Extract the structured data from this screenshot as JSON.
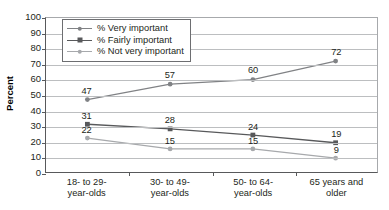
{
  "chart_data": {
    "type": "line",
    "title": "",
    "xlabel": "",
    "ylabel": "Percent",
    "ylim": [
      0,
      100
    ],
    "ytick_step": 10,
    "grid": true,
    "legend_position": "top-left",
    "categories": [
      "18- to 29-\nyear-olds",
      "30- to 49-\nyear-olds",
      "50- to 64-\nyear-olds",
      "65 years and\nolder"
    ],
    "yticks": [
      "0",
      "10",
      "20",
      "30",
      "40",
      "50",
      "60",
      "70",
      "80",
      "90",
      "100"
    ],
    "series": [
      {
        "name": "% Very important",
        "values": [
          47,
          57,
          60,
          72
        ],
        "color": "#808285",
        "marker": "circle"
      },
      {
        "name": "% Fairly important",
        "values": [
          31,
          28,
          24,
          19
        ],
        "color": "#58595b",
        "marker": "square"
      },
      {
        "name": "% Not very important",
        "values": [
          22,
          15,
          15,
          9
        ],
        "color": "#a7a9ac",
        "marker": "circle"
      }
    ]
  },
  "legend": {
    "items": [
      "% Very important",
      "% Fairly important",
      "% Not very important"
    ]
  },
  "axis": {
    "y_title": "Percent"
  }
}
